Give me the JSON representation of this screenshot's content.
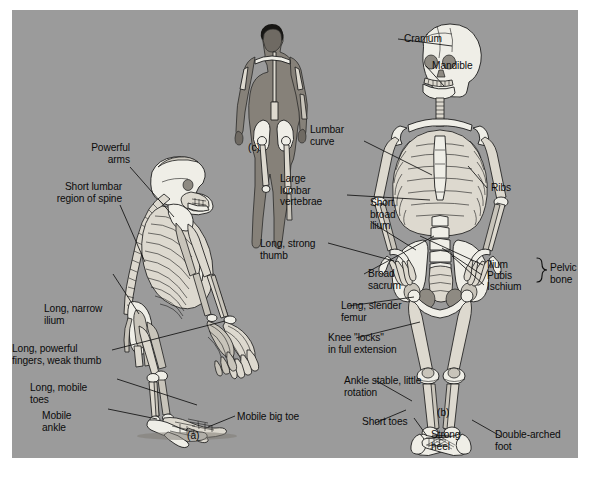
{
  "figure": {
    "background_color": "#9b9b9b",
    "text_color": "#0b0b0b",
    "bone_color": "#efeee7",
    "panel_letters": {
      "a": "(a)",
      "b": "(b)",
      "c": "(c)"
    }
  },
  "ape_labels": {
    "powerful_arms": "Powerful\narms",
    "short_lumbar": "Short lumbar\nregion of spine",
    "long_narrow_ilium": "Long, narrow\nilium",
    "long_powerful_fingers": "Long, powerful\nfingers, weak thumb",
    "long_mobile_toes": "Long, mobile\ntoes",
    "mobile_ankle": "Mobile\nankle",
    "mobile_big_toe": "Mobile big toe"
  },
  "human_labels": {
    "cranium": "Cranium",
    "mandible": "Mandible",
    "lumbar_curve": "Lumbar\ncurve",
    "large_lumbar_vertebrae": "Large\nlumbar\nvertebrae",
    "ribs": "Ribs",
    "short_broad_ilium": "Short,\nbroad\nilium",
    "long_strong_thumb": "Long, strong\nthumb",
    "broad_sacrum": "Broad\nsacrum",
    "ilium": "Ilium",
    "pubis": "Pubis",
    "ischium": "Ischium",
    "pelvic_bone": "Pelvic\nbone",
    "long_slender_femur": "Long, slender\nfemur",
    "knee_locks": "Knee \"locks\"\nin full extension",
    "ankle_stable": "Ankle stable, little\nrotation",
    "short_toes": "Short toes",
    "strong_heel": "Strong\nheel",
    "double_arched_foot": "Double-arched\nfoot"
  }
}
